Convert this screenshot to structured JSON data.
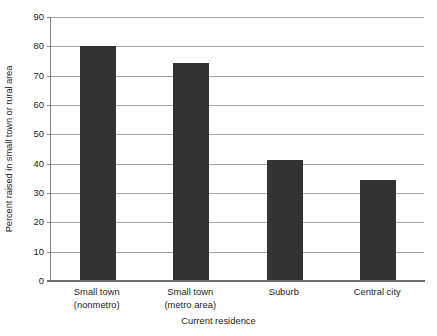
{
  "chart_data": {
    "type": "bar",
    "title": "",
    "xlabel": "Current residence",
    "ylabel": "Percent raised in small town or rural area",
    "categories": [
      "Small town\n(nonmetro)",
      "Small town\n(metro area)",
      "Suburb",
      "Central city"
    ],
    "category_lines": [
      [
        "Small town",
        "(nonmetro)"
      ],
      [
        "Small town",
        "(metro area)"
      ],
      [
        "Suburb",
        ""
      ],
      [
        "Central city",
        ""
      ]
    ],
    "values": [
      80,
      74.3,
      41.2,
      34.3
    ],
    "ylim": [
      0,
      90
    ],
    "ytick_labels": [
      "90",
      "80",
      "70",
      "60",
      "50",
      "40",
      "30",
      "20",
      "10",
      "0"
    ],
    "ytick_values": [
      90,
      80,
      70,
      60,
      50,
      40,
      30,
      20,
      10,
      0
    ],
    "grid": true,
    "legend": false,
    "legend_position": "none",
    "bar_color": "#333333",
    "gridline_color": "#a7a9ac",
    "axis_color": "#808285",
    "background_color": "#ffffff"
  },
  "axes": {
    "y_title": "Percent raised in small town or rural area",
    "x_title": "Current residence"
  }
}
